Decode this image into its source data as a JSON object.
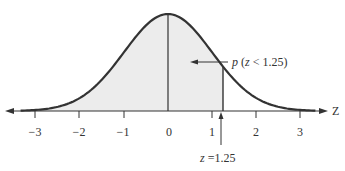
{
  "diagram": {
    "type": "standard-normal-curve",
    "axis_label": "Z",
    "ticks": [
      "−3",
      "−2",
      "−1",
      "0",
      "1",
      "2",
      "3"
    ],
    "tick_values": [
      -3,
      -2,
      -1,
      0,
      1,
      2,
      3
    ],
    "shaded_region": {
      "from": "-inf",
      "to": 1.25
    },
    "probability_label": {
      "p": "p",
      "rest": " (",
      "z": "z",
      "expr": " < 1.25)"
    },
    "z_marker": {
      "z": "z",
      "rest": " =1.25",
      "value": 1.25
    },
    "colors": {
      "curve": "#333333",
      "shade": "#ececec",
      "axis": "#333333",
      "background": "#ffffff"
    }
  }
}
